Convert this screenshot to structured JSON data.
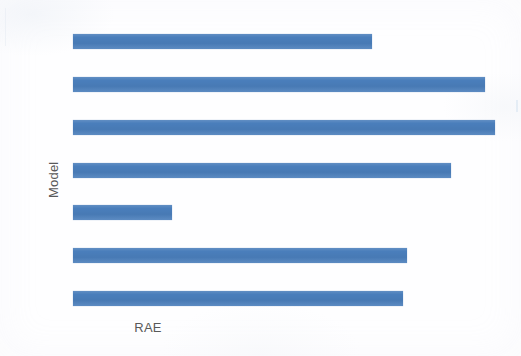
{
  "chart_data": {
    "type": "bar",
    "orientation": "horizontal",
    "title": "",
    "xlabel": "RAE",
    "ylabel": "Model",
    "categories": [
      "",
      "",
      "",
      "",
      "",
      "",
      ""
    ],
    "values": [
      299,
      412,
      422,
      378,
      99,
      334,
      330
    ],
    "value_unit": "px-length",
    "xlim": [
      0,
      422
    ],
    "grid": false,
    "legend": false,
    "tick_labels_visible": false,
    "series": [
      {
        "name": "RAE",
        "color": "#4a7ebb",
        "values": [
          299,
          412,
          422,
          378,
          99,
          334,
          330
        ]
      }
    ],
    "bars": [
      {
        "index": 1,
        "value": 299,
        "length_px": 299,
        "end_px": 372,
        "top_px": 34
      },
      {
        "index": 2,
        "value": 412,
        "length_px": 412,
        "end_px": 485,
        "top_px": 77
      },
      {
        "index": 3,
        "value": 422,
        "length_px": 422,
        "end_px": 495,
        "top_px": 120
      },
      {
        "index": 4,
        "value": 378,
        "length_px": 378,
        "end_px": 451,
        "top_px": 163
      },
      {
        "index": 5,
        "value": 99,
        "length_px": 99,
        "end_px": 172,
        "top_px": 205
      },
      {
        "index": 6,
        "value": 334,
        "length_px": 334,
        "end_px": 407,
        "top_px": 248
      },
      {
        "index": 7,
        "value": 330,
        "length_px": 330,
        "end_px": 403,
        "top_px": 291
      }
    ]
  },
  "axes": {
    "y_title": "Model",
    "x_title": "RAE"
  },
  "colors": {
    "bar": "#4a7ebb",
    "axis_text": "#595959",
    "background": "#fefeff"
  }
}
